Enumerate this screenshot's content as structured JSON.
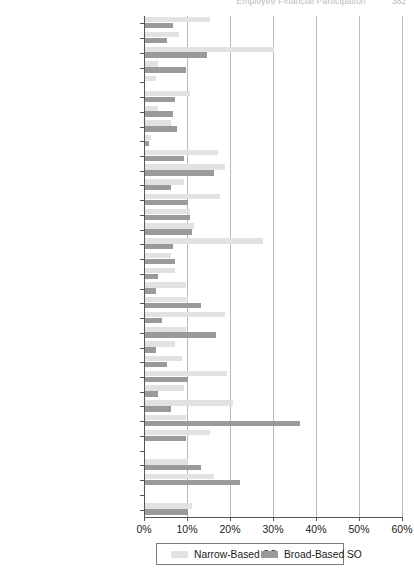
{
  "running_header": {
    "title": "Employee Financial Participation",
    "page_number": "382"
  },
  "legend": {
    "position": "bottom-center",
    "entries": [
      {
        "label": "Narrow-Based SO",
        "color": "#e2e2e2"
      },
      {
        "label": "Broad-Based SO",
        "color": "#9a9a9a"
      }
    ]
  },
  "axis": {
    "x_ticks": [
      "0%",
      "10%",
      "20%",
      "30%",
      "40%",
      "50%",
      "60%"
    ],
    "x_min": 0,
    "x_max": 60
  },
  "chart_data": {
    "type": "bar",
    "orientation": "horizontal",
    "title": "",
    "xlabel": "",
    "ylabel": "",
    "xlim": [
      0,
      60
    ],
    "xtick_labels": [
      "0%",
      "10%",
      "20%",
      "30%",
      "40%",
      "50%",
      "60%"
    ],
    "grid": "vertical",
    "legend_position": "bottom-center",
    "categories": [
      "Australia",
      "Austria",
      "Belgium",
      "Bulgaria",
      "Cyprus",
      "Denmark",
      "Estonia",
      "Finland",
      "France",
      "Germany",
      "Greece",
      "Hungary",
      "Iceland",
      "Ireland",
      "Israel",
      "Italy",
      "Japan",
      "Lithuania",
      "Norway",
      "Philippines",
      "Russia",
      "Serbia",
      "Slovakia",
      "Slovenia",
      "South Africa",
      "Sweden",
      "Switzerland",
      "Taiwan",
      "The Netherlands",
      "Turkish Cypriot Community",
      "United Kingdom",
      "USA",
      "",
      "Total"
    ],
    "series": [
      {
        "name": "Narrow-Based SO",
        "color": "#e2e2e2",
        "values": [
          15.0,
          8.0,
          30.0,
          3.0,
          2.5,
          10.5,
          3.0,
          6.0,
          1.5,
          17.0,
          18.5,
          9.0,
          17.5,
          10.5,
          11.5,
          27.5,
          6.0,
          7.0,
          9.5,
          10.0,
          18.5,
          9.5,
          7.0,
          8.5,
          19.0,
          9.0,
          20.5,
          9.5,
          15.0,
          0.0,
          10.0,
          16.0,
          null,
          11.0
        ]
      },
      {
        "name": "Broad-Based SO",
        "color": "#9a9a9a",
        "values": [
          6.5,
          5.0,
          14.5,
          9.5,
          0.0,
          7.0,
          6.5,
          7.5,
          1.0,
          9.0,
          16.0,
          6.0,
          10.0,
          10.5,
          11.0,
          6.5,
          7.0,
          3.0,
          2.5,
          13.0,
          4.0,
          16.5,
          2.5,
          5.0,
          10.0,
          3.0,
          6.0,
          36.0,
          9.5,
          0.0,
          13.0,
          22.0,
          null,
          10.0
        ]
      }
    ]
  }
}
